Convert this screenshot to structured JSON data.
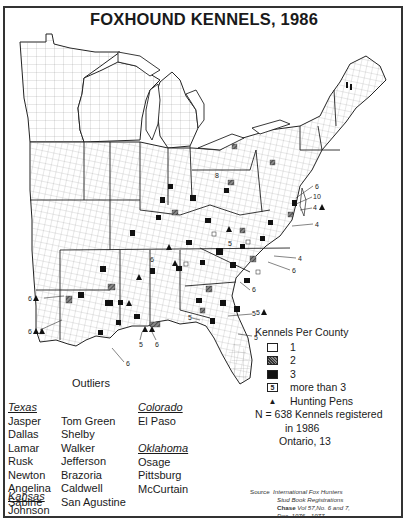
{
  "title": "FOXHOUND KENNELS, 1986",
  "legend": {
    "header": "Kennels Per County",
    "items": [
      {
        "symbol": "open-square",
        "label": "1"
      },
      {
        "symbol": "hatched-square",
        "label": "2"
      },
      {
        "symbol": "filled-square",
        "label": "3"
      },
      {
        "symbol": "boxed-5",
        "box_text": "5",
        "label": "more than 3"
      },
      {
        "symbol": "triangle",
        "label": "Hunting Pens"
      }
    ],
    "note_line1": "N = 638 Kennels registered",
    "note_line2": "in 1986",
    "note_line3": "Ontario, 13"
  },
  "outliers": {
    "title": "Outliers",
    "states": [
      {
        "name": "Texas",
        "counties_col1": [
          "Jasper",
          "Dallas",
          "Lamar",
          "Rusk",
          "Newton",
          "Angelina",
          "Sabine"
        ],
        "counties_col2": [
          "Tom Green",
          "Shelby",
          "Walker",
          "Jefferson",
          "Brazoria",
          "Caldwell",
          "San Agustine"
        ]
      },
      {
        "name": "Colorado",
        "counties": [
          "El Paso"
        ]
      },
      {
        "name": "Oklahoma",
        "counties": [
          "Osage",
          "Pittsburg",
          "McCurtain"
        ]
      },
      {
        "name": "Kansas",
        "counties": [
          "Johnson"
        ]
      }
    ]
  },
  "source": {
    "label": "Source",
    "line1": "International Fox Hunters",
    "line2": "Stud Book Registrations",
    "line3_bold": "Chase",
    "line3": "Vol 57,No. 6 and 7,",
    "line4": "Dec. 1976 - 1977"
  },
  "map_annotations": [
    {
      "label": "8",
      "region": "Ohio"
    },
    {
      "label": "6",
      "region": "Maryland"
    },
    {
      "label": "10",
      "region": "Maryland"
    },
    {
      "label": "4 ▲",
      "region": "Delaware/Maryland coast"
    },
    {
      "label": "4",
      "region": "Virginia coast"
    },
    {
      "label": "4",
      "region": "North Carolina"
    },
    {
      "label": "6",
      "region": "North Carolina"
    },
    {
      "label": "6",
      "region": "South Carolina"
    },
    {
      "label": "5 ▲",
      "region": "Georgia coast"
    },
    {
      "label": "5",
      "region": "Florida northeast"
    },
    {
      "label": "5",
      "region": "Florida central"
    },
    {
      "label": "5",
      "region": "Florida west"
    },
    {
      "label": "5",
      "region": "Alabama gulf"
    },
    {
      "label": "6",
      "region": "Alabama gulf"
    },
    {
      "label": "6",
      "region": "Louisiana/Mississippi"
    },
    {
      "label": "6 ▲",
      "region": "Arkansas/Louisiana west"
    },
    {
      "label": "6 ▲▲",
      "region": "Louisiana west"
    },
    {
      "label": "5",
      "region": "Tennessee"
    },
    {
      "label": "6",
      "region": "Kentucky/Tennessee"
    }
  ]
}
